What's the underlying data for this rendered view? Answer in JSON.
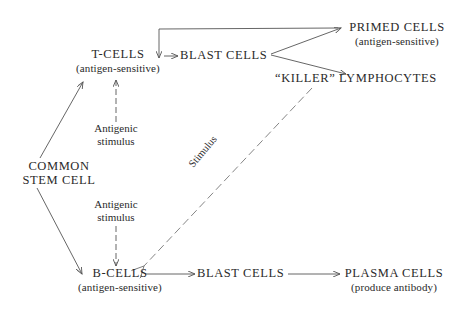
{
  "diagram": {
    "nodes": {
      "t_cells": {
        "title": "T-CELLS",
        "subtitle": "(antigen-sensitive)"
      },
      "t_blast": {
        "title": "BLAST CELLS"
      },
      "primed": {
        "title": "PRIMED CELLS",
        "subtitle": "(antigen-sensitive)"
      },
      "killer": {
        "title": "“KILLER” LYMPHOCYTES"
      },
      "stem": {
        "line1": "COMMON",
        "line2": "STEM CELL"
      },
      "b_cells": {
        "title": "B-CELLS",
        "subtitle": "(antigen-sensitive)"
      },
      "b_blast": {
        "title": "BLAST CELLS"
      },
      "plasma": {
        "title": "PLASMA CELLS",
        "subtitle": "(produce antibody)"
      }
    },
    "labels": {
      "t_antigen": {
        "line1": "Antigenic",
        "line2": "stimulus"
      },
      "b_antigen": {
        "line1": "Antigenic",
        "line2": "stimulus"
      },
      "killer_stimulus": "Stimulus"
    },
    "edges": [
      {
        "from": "stem",
        "to": "t_cells",
        "style": "solid"
      },
      {
        "from": "stem",
        "to": "b_cells",
        "style": "solid"
      },
      {
        "from": "t_antigen",
        "to": "t_cells",
        "style": "dashed"
      },
      {
        "from": "b_antigen",
        "to": "b_cells",
        "style": "dashed"
      },
      {
        "from": "t_cells",
        "to": "t_blast",
        "style": "solid"
      },
      {
        "from": "t_blast",
        "to": "primed",
        "style": "solid"
      },
      {
        "from": "t_blast",
        "to": "killer",
        "style": "solid"
      },
      {
        "from": "primed",
        "to": "t_blast",
        "style": "solid",
        "note": "feedback loop over top"
      },
      {
        "from": "killer",
        "to": "b_cells",
        "style": "dashed",
        "label": "Stimulus"
      },
      {
        "from": "b_cells",
        "to": "b_blast",
        "style": "solid"
      },
      {
        "from": "b_blast",
        "to": "plasma",
        "style": "solid"
      }
    ],
    "colors": {
      "ink": "#2a2a2a",
      "line": "#555555",
      "background": "#ffffff"
    }
  }
}
